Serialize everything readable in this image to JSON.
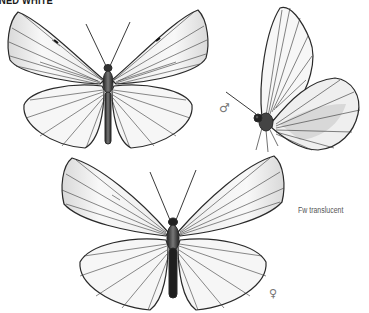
{
  "plate": {
    "title": "NED WHITE",
    "note": "Fw translucent",
    "symbols": {
      "male": "♂",
      "female": "♀"
    }
  },
  "figures": [
    {
      "label": "male-upperside",
      "view": "dorsal"
    },
    {
      "label": "male-side",
      "view": "lateral"
    },
    {
      "label": "female-upperside",
      "view": "dorsal"
    }
  ],
  "colors": {
    "ink": "#1a1a1a",
    "vein": "#333333",
    "wing_fill": "#f7f7f7",
    "shade": "#bdbdbd",
    "label": "#555555"
  }
}
